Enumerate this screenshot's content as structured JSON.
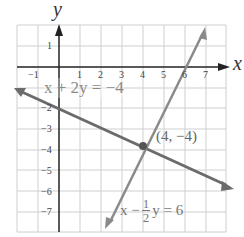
{
  "figure": {
    "axis_labels": {
      "x": "x",
      "y": "y"
    },
    "x_ticks": [
      "−1",
      "1",
      "2",
      "3",
      "4",
      "5",
      "6",
      "7"
    ],
    "y_ticks": [
      "1",
      "−2",
      "−3",
      "−4",
      "−5",
      "−6",
      "−7"
    ],
    "lines": [
      {
        "name": "line-1",
        "equation": "x + 2y = −4",
        "color": "#6b6b6b"
      },
      {
        "name": "line-2",
        "equation_left": "x −",
        "frac_num": "1",
        "frac_den": "2",
        "equation_right": "y = 6",
        "color": "#8a8a8a"
      }
    ],
    "intersection": {
      "label": "(4, −4)",
      "x": 4,
      "y": -4
    },
    "colors": {
      "grid": "#c8c8c8",
      "axis": "#222222",
      "text": "#555555"
    }
  }
}
